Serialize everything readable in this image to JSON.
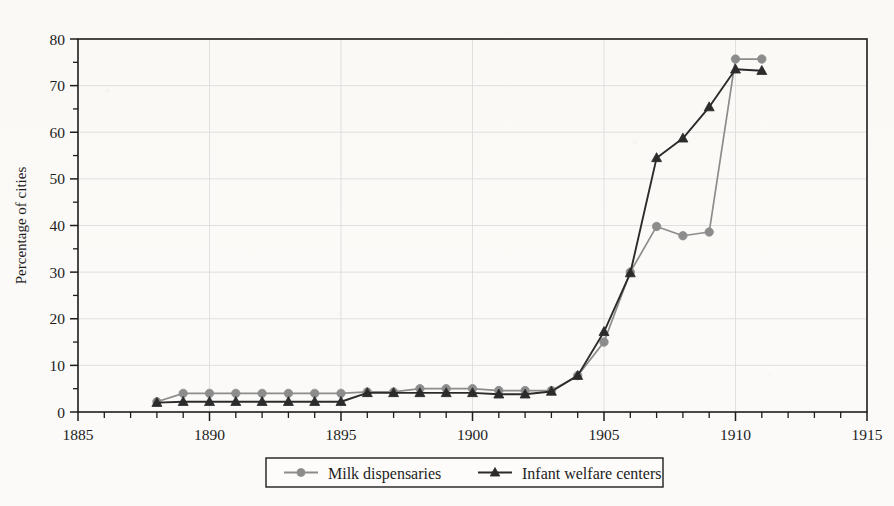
{
  "chart_data": {
    "type": "line",
    "title": "",
    "xlabel": "",
    "ylabel": "Percentage of cities",
    "xlim": [
      1885,
      1915
    ],
    "ylim": [
      0,
      80
    ],
    "grid": true,
    "legend_position": "below-center",
    "x_ticks_major": [
      1885,
      1890,
      1895,
      1900,
      1905,
      1910,
      1915
    ],
    "x_tick_labels": [
      "1885",
      "1890",
      "1895",
      "1900",
      "1905",
      "1910",
      "1915"
    ],
    "x_tick_minor_step": 1,
    "y_ticks_major": [
      0,
      10,
      20,
      30,
      40,
      50,
      60,
      70,
      80
    ],
    "y_tick_labels": [
      "0",
      "10",
      "20",
      "30",
      "40",
      "50",
      "60",
      "70",
      "80"
    ],
    "y_tick_minor_step": 5,
    "x": [
      1888,
      1889,
      1890,
      1891,
      1892,
      1893,
      1894,
      1895,
      1896,
      1897,
      1898,
      1899,
      1900,
      1901,
      1902,
      1903,
      1904,
      1905,
      1906,
      1907,
      1908,
      1909,
      1910,
      1911
    ],
    "series": [
      {
        "name": "Milk dispensaries",
        "color": "#8c8c8c",
        "marker": "circle",
        "values": [
          2.2,
          4.0,
          4.0,
          4.0,
          4.0,
          4.0,
          4.0,
          4.0,
          4.3,
          4.3,
          5.0,
          5.0,
          5.0,
          4.6,
          4.6,
          4.6,
          7.8,
          15.0,
          30.0,
          39.8,
          37.8,
          38.6,
          75.7,
          75.7
        ]
      },
      {
        "name": "Infant welfare centers",
        "color": "#2b2b2b",
        "marker": "triangle",
        "values": [
          2.0,
          2.2,
          2.2,
          2.2,
          2.2,
          2.2,
          2.2,
          2.2,
          4.1,
          4.1,
          4.1,
          4.1,
          4.1,
          3.8,
          3.8,
          4.4,
          7.8,
          17.2,
          29.8,
          54.5,
          58.7,
          65.4,
          73.5,
          73.2
        ]
      }
    ]
  },
  "legend": {
    "items": [
      {
        "label": "Milk dispensaries",
        "marker": "circle",
        "color": "#8c8c8c"
      },
      {
        "label": "Infant welfare centers",
        "marker": "triangle",
        "color": "#2b2b2b"
      }
    ]
  },
  "colors": {
    "axis": "#1d1d1d",
    "grid": "#dcdcdc",
    "background": "#fbfaf8",
    "milk": "#8c8c8c",
    "infant": "#2b2b2b"
  }
}
